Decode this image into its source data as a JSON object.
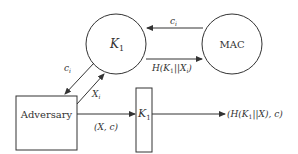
{
  "diagram": {
    "nodes": {
      "k1_circle": {
        "label": "K",
        "sub": "1",
        "shape": "circle"
      },
      "mac_circle": {
        "label": "MAC",
        "shape": "circle"
      },
      "adversary_box": {
        "label": "Adversary",
        "shape": "rectangle"
      },
      "k1_box": {
        "label": "K",
        "sub": "1",
        "shape": "rectangle"
      }
    },
    "edges": {
      "mac_to_k1": {
        "label": "c",
        "sub": "i"
      },
      "k1_to_mac": {
        "label_pre": "H(K",
        "sub1": "1",
        "label_mid": "||X",
        "sub2": "i",
        "label_post": ")"
      },
      "k1_to_adversary": {
        "label": "c",
        "sub": "i"
      },
      "adversary_to_k1": {
        "label": "X",
        "sub": "i"
      },
      "adversary_to_k1box": {
        "label": "(X, c)"
      },
      "k1box_output": {
        "label_pre": "(H(K",
        "sub1": "1",
        "label_post": "||X), c)"
      }
    },
    "colors": {
      "stroke": "#333333",
      "background": "#ffffff"
    }
  }
}
